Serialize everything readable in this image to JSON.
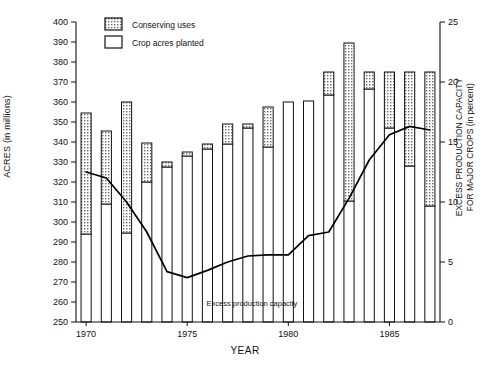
{
  "chart_data": {
    "type": "bar",
    "title": "",
    "xlabel": "YEAR",
    "ylabel": "ACRES (in millions)",
    "ylabel_right_line1": "EXCESS PRODUCTION CAPACITY",
    "ylabel_right_line2": "FOR MAJOR CROPS (in percent)",
    "categories": [
      1970,
      1971,
      1972,
      1973,
      1974,
      1975,
      1976,
      1977,
      1978,
      1979,
      1980,
      1981,
      1982,
      1983,
      1984,
      1985,
      1986,
      1987
    ],
    "xtick_labels": [
      "1970",
      "1975",
      "1980",
      "1985"
    ],
    "xtick_years": [
      1970,
      1975,
      1980,
      1985
    ],
    "ylim": [
      250,
      400
    ],
    "ytick_labels": [
      "250",
      "260",
      "270",
      "280",
      "290",
      "300",
      "310",
      "320",
      "330",
      "340",
      "350",
      "360",
      "370",
      "380",
      "390",
      "400"
    ],
    "ytick_values": [
      250,
      260,
      270,
      280,
      290,
      300,
      310,
      320,
      330,
      340,
      350,
      360,
      370,
      380,
      390,
      400
    ],
    "ylim_right": [
      0,
      25
    ],
    "ytick_right_labels": [
      "0",
      "5",
      "10",
      "15",
      "20",
      "25"
    ],
    "ytick_right_values": [
      0,
      5,
      10,
      15,
      20,
      25
    ],
    "grid": false,
    "legend_position": "top-center",
    "series": [
      {
        "name": "Crop acres planted",
        "style": "white-fill",
        "values": [
          294.0,
          309.0,
          294.5,
          320.0,
          327.5,
          333.0,
          336.5,
          339.0,
          347.0,
          337.5,
          360.0,
          360.5,
          363.5,
          310.5,
          366.5,
          347.0,
          328.0,
          308.0
        ]
      },
      {
        "name": "Conserving uses",
        "style": "dotted-fill",
        "values": [
          60.5,
          36.5,
          65.5,
          19.5,
          2.5,
          2.0,
          2.5,
          10.0,
          2.0,
          20.0,
          0.0,
          0.0,
          11.5,
          79.0,
          8.5,
          28.0,
          47.0,
          67.0
        ]
      }
    ],
    "totals": [
      354.5,
      345.5,
      360.0,
      339.5,
      330.0,
      335.0,
      339.0,
      349.0,
      349.0,
      357.5,
      360.0,
      360.5,
      375.0,
      389.5,
      375.0,
      375.0,
      375.0,
      375.0
    ],
    "line_series": {
      "name": "Excess production capacity",
      "axis": "right",
      "x": [
        1970,
        1971,
        1972,
        1973,
        1974,
        1975,
        1976,
        1977,
        1978,
        1979,
        1980,
        1981,
        1982,
        1983,
        1984,
        1985,
        1986,
        1987
      ],
      "values": [
        12.5,
        12.0,
        10.0,
        7.5,
        4.2,
        3.7,
        4.3,
        5.0,
        5.5,
        5.6,
        5.6,
        7.2,
        7.5,
        10.3,
        13.5,
        15.6,
        16.3,
        16.0
      ]
    },
    "annotations": [
      {
        "name": "excess-production-capacity-label",
        "text": "Excess production capacity",
        "x": 1978.2,
        "y": 258
      }
    ],
    "legend": [
      {
        "label": "Conserving uses",
        "swatch": "dotted"
      },
      {
        "label": "Crop acres planted",
        "swatch": "white"
      }
    ],
    "colors": {
      "axis": "#111111",
      "bar_outline": "#111111",
      "bar_white": "#ffffff",
      "bar_dot_bg": "#e6e6e6",
      "bar_dot_fg": "#555555",
      "line": "#000000"
    }
  }
}
